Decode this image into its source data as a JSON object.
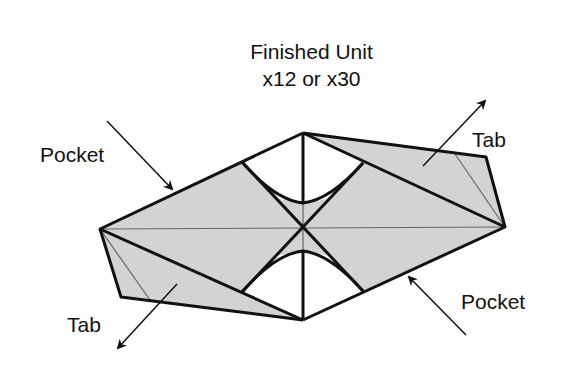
{
  "title": {
    "line1": "Finished Unit",
    "line2": "x12 or x30"
  },
  "labels": {
    "pocket_top_left": "Pocket",
    "pocket_bottom_right": "Pocket",
    "tab_top_right": "Tab",
    "tab_bottom_left": "Tab"
  },
  "colors": {
    "fill": "#d3d3d3",
    "stroke": "#111111",
    "thin_line": "#555555"
  }
}
